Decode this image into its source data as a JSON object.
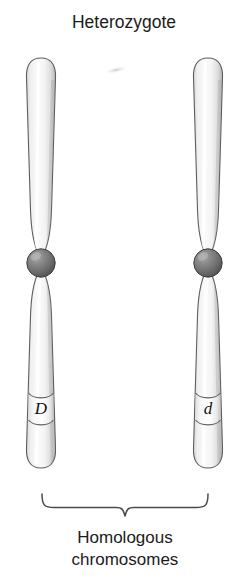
{
  "figure": {
    "title": "Heterozygote",
    "caption_line1": "Homologous",
    "caption_line2": "chromosomes",
    "background_color": "#ffffff",
    "outline_color": "#5e5e5e",
    "text_color": "#1b1b1b"
  },
  "chromosomes": [
    {
      "id": "left",
      "allele_label": "D",
      "allele_type": "dominant",
      "center_x": 41,
      "top_y": 58,
      "bottom_y": 488,
      "centromere_y": 263,
      "centromere_color": "#6a6a6a",
      "arm_fill_color": "#f0f0f0"
    },
    {
      "id": "right",
      "allele_label": "d",
      "allele_type": "recessive",
      "center_x": 208,
      "top_y": 58,
      "bottom_y": 488,
      "centromere_y": 263,
      "centromere_color": "#6a6a6a",
      "arm_fill_color": "#f0f0f0"
    }
  ],
  "brace": {
    "left_x": 42,
    "right_x": 208,
    "top_y": 494,
    "tip_y": 517,
    "center_x": 125
  },
  "artifact": {
    "present": true,
    "x": 116,
    "y": 70,
    "description": "faint scan smudge"
  }
}
